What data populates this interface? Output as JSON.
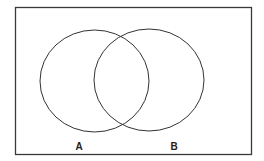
{
  "diagram": {
    "type": "venn",
    "universe": {
      "x": 15.5,
      "y": 7.5,
      "width": 236,
      "height": 147,
      "stroke": "#3a3a3a"
    },
    "sets": [
      {
        "label": "A",
        "cx": 94.5,
        "cy": 81,
        "rx": 54.5,
        "ry": 51,
        "label_x": 79,
        "label_y": 150
      },
      {
        "label": "B",
        "cx": 149,
        "cy": 80,
        "rx": 55,
        "ry": 51,
        "label_x": 174,
        "label_y": 150
      }
    ],
    "stroke_color": "#333333"
  }
}
